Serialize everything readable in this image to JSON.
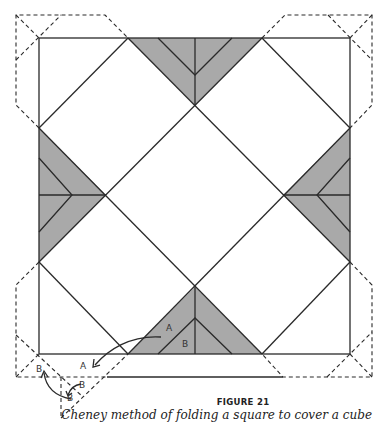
{
  "figure": {
    "number_label": "FIGURE 21",
    "caption": "Cheney method of folding a square to cover a cube",
    "shade_color": "#a9a9a9",
    "line_color": "#2a2a2a",
    "labels": {
      "fold_a_on_square": "A",
      "fold_b_on_square": "B",
      "fold_a_target": "A",
      "flap_b_1": "B",
      "flap_b_2": "B",
      "flap_b_3": "B"
    }
  }
}
